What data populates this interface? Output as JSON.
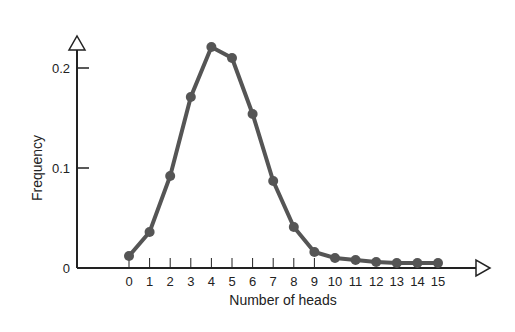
{
  "chart_data": {
    "type": "line",
    "title": "",
    "xlabel": "Number of heads",
    "ylabel": "Frequency",
    "x": [
      0,
      1,
      2,
      3,
      4,
      5,
      6,
      7,
      8,
      9,
      10,
      11,
      12,
      13,
      14,
      15
    ],
    "series": [
      {
        "name": "Frequency",
        "values": [
          0.012,
          0.036,
          0.092,
          0.171,
          0.221,
          0.21,
          0.154,
          0.087,
          0.041,
          0.016,
          0.01,
          0.008,
          0.006,
          0.005,
          0.005,
          0.005
        ]
      }
    ],
    "xticks": [
      "0",
      "1",
      "2",
      "3",
      "4",
      "5",
      "6",
      "7",
      "8",
      "9",
      "10",
      "11",
      "12",
      "13",
      "14",
      "15"
    ],
    "yticks": [
      "0",
      "0.1",
      "0.2"
    ],
    "ylim": [
      0,
      0.2
    ],
    "grid": false,
    "legend": null,
    "colors": {
      "line": "#555555",
      "marker": "#555555",
      "axis": "#222222"
    }
  }
}
